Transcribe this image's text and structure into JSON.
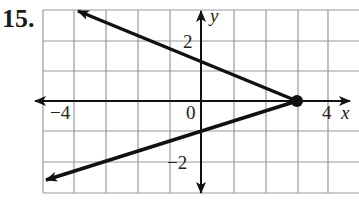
{
  "problem": {
    "number": "15."
  },
  "graph": {
    "x_axis_label": "x",
    "y_axis_label": "y",
    "tick_labels": {
      "x_neg": "−4",
      "origin": "0",
      "x_pos": "4",
      "y_pos": "2",
      "y_neg": "−2"
    },
    "grid": {
      "xmin": -5,
      "xmax": 5,
      "ymin": -3,
      "ymax": 3,
      "step": 1
    },
    "vertex": {
      "x": 3,
      "y": 0
    },
    "rays": [
      {
        "name": "upper-ray",
        "from": [
          3,
          0
        ],
        "to": [
          -4,
          3
        ],
        "arrow": true
      },
      {
        "name": "lower-ray",
        "from": [
          3,
          0
        ],
        "to": [
          -5,
          -2.6
        ],
        "arrow": true
      }
    ],
    "colors": {
      "grid": "#9a9a9a",
      "ink": "#111111"
    }
  }
}
